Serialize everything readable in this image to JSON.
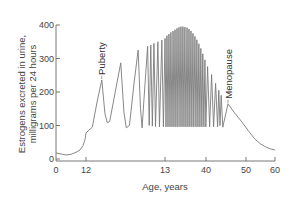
{
  "chart_data": {
    "type": "line",
    "title": "",
    "xlabel": "Age, years",
    "ylabel_lines": [
      "Estrogens excreted in urine,",
      "milligrams per 24 hours"
    ],
    "ylabel": "Estrogens excreted in urine, milligrams per 24 hours",
    "ylim": [
      0,
      400
    ],
    "y_ticks": [
      0,
      100,
      200,
      300,
      400
    ],
    "y_tick_labels": [
      "0",
      "100",
      "200",
      "300",
      "400"
    ],
    "x_ticks": [
      0,
      12,
      13,
      40,
      50,
      60
    ],
    "x_tick_labels": [
      "0",
      "12",
      "13",
      "40",
      "50",
      "60"
    ],
    "x_scale": "piecewise (non-uniform ticks)",
    "grid": false,
    "legend": "none",
    "line_color": "#7a7a7a",
    "annotations": [
      {
        "text": "Puberty",
        "age": 12.2,
        "value": 236
      },
      {
        "text": "Menopause",
        "age": 45.5,
        "value": 165
      }
    ],
    "series": [
      {
        "name": "Estrogen excretion",
        "points": [
          [
            0,
            18
          ],
          [
            2,
            15
          ],
          [
            4,
            12
          ],
          [
            6,
            14
          ],
          [
            8,
            20
          ],
          [
            9.6,
            27
          ],
          [
            10.8,
            40
          ],
          [
            11.6,
            58
          ],
          [
            12.0,
            78
          ],
          [
            12.08,
            95
          ],
          [
            12.14,
            170
          ],
          [
            12.2,
            236
          ],
          [
            12.24,
            135
          ],
          [
            12.27,
            108
          ],
          [
            12.3,
            112
          ],
          [
            12.37,
            200
          ],
          [
            12.44,
            287
          ],
          [
            12.48,
            140
          ],
          [
            12.51,
            93
          ],
          [
            12.55,
            100
          ],
          [
            12.61,
            230
          ],
          [
            12.66,
            325
          ],
          [
            12.69,
            150
          ],
          [
            12.71,
            93
          ],
          [
            12.74,
            200
          ],
          [
            12.78,
            337
          ],
          [
            12.8,
            100
          ],
          [
            12.82,
            340
          ],
          [
            12.84,
            98
          ],
          [
            12.86,
            345
          ],
          [
            12.88,
            97
          ],
          [
            12.91,
            350
          ],
          [
            12.93,
            96
          ],
          [
            12.96,
            355
          ],
          [
            12.98,
            96
          ],
          [
            13.01,
            360
          ],
          [
            13.66,
            96
          ],
          [
            14.3,
            368
          ],
          [
            14.97,
            96
          ],
          [
            15.6,
            373
          ],
          [
            16.3,
            96
          ],
          [
            16.9,
            378
          ],
          [
            17.6,
            96
          ],
          [
            18.3,
            382
          ],
          [
            18.9,
            96
          ],
          [
            19.6,
            386
          ],
          [
            20.2,
            96
          ],
          [
            20.9,
            390
          ],
          [
            21.5,
            96
          ],
          [
            22.2,
            393
          ],
          [
            22.9,
            96
          ],
          [
            23.5,
            395
          ],
          [
            24.2,
            96
          ],
          [
            24.8,
            395
          ],
          [
            25.5,
            96
          ],
          [
            26.1,
            394
          ],
          [
            26.8,
            96
          ],
          [
            27.5,
            392
          ],
          [
            28.1,
            96
          ],
          [
            28.8,
            388
          ],
          [
            29.4,
            96
          ],
          [
            30.1,
            382
          ],
          [
            30.7,
            96
          ],
          [
            31.4,
            375
          ],
          [
            32.0,
            96
          ],
          [
            32.7,
            366
          ],
          [
            33.4,
            96
          ],
          [
            34.0,
            356
          ],
          [
            34.7,
            96
          ],
          [
            35.3,
            344
          ],
          [
            36.0,
            96
          ],
          [
            36.6,
            330
          ],
          [
            37.3,
            96
          ],
          [
            37.9,
            314
          ],
          [
            38.6,
            96
          ],
          [
            39.3,
            296
          ],
          [
            39.9,
            96
          ],
          [
            40.4,
            276
          ],
          [
            40.9,
            96
          ],
          [
            41.4,
            252
          ],
          [
            41.9,
            96
          ],
          [
            42.4,
            226
          ],
          [
            42.9,
            96
          ],
          [
            43.2,
            205
          ],
          [
            43.5,
            100
          ],
          [
            43.8,
            190
          ],
          [
            44.2,
            95
          ],
          [
            45.5,
            165
          ],
          [
            47,
            140
          ],
          [
            49,
            110
          ],
          [
            51,
            82
          ],
          [
            53,
            60
          ],
          [
            55,
            45
          ],
          [
            57,
            35
          ],
          [
            58.5,
            30
          ],
          [
            60,
            27
          ]
        ]
      }
    ]
  }
}
